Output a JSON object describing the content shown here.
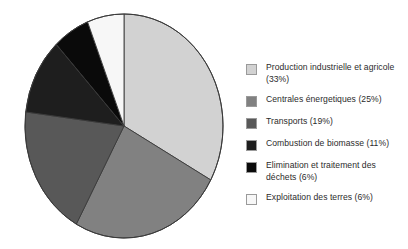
{
  "chart_data": {
    "type": "pie",
    "title": "",
    "subtitle": "",
    "xlabel": "",
    "ylabel": "",
    "legend_position": "right",
    "grid": false,
    "start_angle_deg": 0,
    "direction": "clockwise",
    "units": "percent",
    "categories": [
      "Production industrielle et agricole",
      "Centrales énergetiques",
      "Transports",
      "Combustion de biomasse",
      "Elimination et traitement des déchets",
      "Exploitation des terres"
    ],
    "values": [
      33,
      25,
      19,
      11,
      6,
      6
    ],
    "colors": [
      "#d2d2d2",
      "#818181",
      "#585858",
      "#1e1e1e",
      "#0a0a0a",
      "#f7f7f7"
    ],
    "slice_outline_color": "#3a3a3a",
    "slices": [
      {
        "label": "Production industrielle et agricole",
        "value": 33,
        "color": "#d2d2d2"
      },
      {
        "label": "Centrales énergetiques",
        "value": 25,
        "color": "#818181"
      },
      {
        "label": "Transports",
        "value": 19,
        "color": "#585858"
      },
      {
        "label": "Combustion de biomasse",
        "value": 11,
        "color": "#1e1e1e"
      },
      {
        "label": "Elimination et traitement des déchets",
        "value": 6,
        "color": "#0a0a0a"
      },
      {
        "label": "Exploitation des terres",
        "value": 6,
        "color": "#f7f7f7"
      }
    ]
  },
  "legend": {
    "entries": [
      {
        "label": "Production industrielle et agricole (33%)",
        "color": "#d2d2d2"
      },
      {
        "label": "Centrales énergetiques (25%)",
        "color": "#818181"
      },
      {
        "label": "Transports (19%)",
        "color": "#585858"
      },
      {
        "label": "Combustion de biomasse (11%)",
        "color": "#1e1e1e"
      },
      {
        "label": "Elimination et traitement des déchets (6%)",
        "color": "#0a0a0a"
      },
      {
        "label": "Exploitation des terres (6%)",
        "color": "#f7f7f7"
      }
    ]
  }
}
